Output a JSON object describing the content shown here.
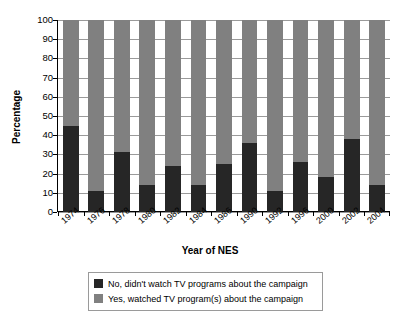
{
  "chart_data": {
    "type": "bar",
    "subtype": "stacked-percentage-column",
    "title": "",
    "xlabel": "Year of NES",
    "ylabel": "Percentage",
    "ylim": [
      0,
      100
    ],
    "yticks": [
      0,
      10,
      20,
      30,
      40,
      50,
      60,
      70,
      80,
      90,
      100
    ],
    "ytick_labels": [
      "0",
      "10",
      "20",
      "30",
      "40",
      "50",
      "60",
      "70",
      "80",
      "90",
      "100"
    ],
    "grid": true,
    "legend_position": "below",
    "categories": [
      "1974",
      "1976",
      "1978",
      "1980",
      "1982",
      "1984",
      "1986",
      "1990",
      "1992",
      "1996",
      "2000",
      "2002",
      "2004"
    ],
    "series": [
      {
        "name": "No, didn't watch TV programs about the campaign",
        "color": "#262626",
        "values": [
          45,
          11,
          31,
          14,
          24,
          14,
          25,
          36,
          11,
          26,
          18,
          38,
          14
        ]
      },
      {
        "name": "Yes, watched TV program(s) about the campaign",
        "color": "#808080",
        "values": [
          55,
          89,
          69,
          86,
          76,
          86,
          75,
          64,
          89,
          74,
          82,
          62,
          86
        ]
      }
    ]
  },
  "legend": {
    "items": [
      {
        "label": "No, didn't watch TV programs about the campaign",
        "color": "#262626"
      },
      {
        "label": "Yes, watched TV program(s) about the campaign",
        "color": "#808080"
      }
    ]
  },
  "axes": {
    "y_title": "Percentage",
    "x_title": "Year of NES"
  }
}
